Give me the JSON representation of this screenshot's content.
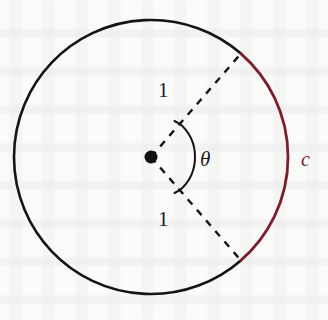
{
  "figure": {
    "background_color": "#fbfbfa",
    "circle": {
      "name": "unit-circle",
      "center_x": 151,
      "center_y": 157,
      "radius": 137,
      "stroke_color": "#141414",
      "stroke_width": 2.6
    },
    "arc": {
      "name": "arc-c",
      "label": "c",
      "color": "#7a1f2e",
      "stroke_width": 2.8,
      "start_angle_deg": -49,
      "end_angle_deg": 49,
      "label_x": 303,
      "label_y": 152
    },
    "center_dot": {
      "name": "center-point",
      "x": 151,
      "y": 157,
      "radius": 6.5,
      "color": "#101010"
    },
    "radii": [
      {
        "name": "radius-upper",
        "label": "1",
        "angle_deg": -49,
        "label_x": 165,
        "label_y": 87,
        "dash": "7 7",
        "color": "#151515",
        "stroke_width": 2.4
      },
      {
        "name": "radius-lower",
        "label": "1",
        "angle_deg": 49,
        "label_x": 165,
        "label_y": 216,
        "dash": "7 7",
        "color": "#151515",
        "stroke_width": 2.4
      }
    ],
    "angle": {
      "name": "angle-theta",
      "label": "θ",
      "symbol_name": "theta-symbol",
      "arc_radius": 44,
      "start_angle_deg": -49,
      "end_angle_deg": 49,
      "color": "#151515",
      "stroke_width": 2.0,
      "label_x": 203,
      "label_y": 150
    }
  }
}
